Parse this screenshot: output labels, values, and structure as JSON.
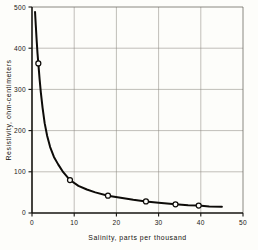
{
  "chart_data": {
    "type": "line",
    "title": "",
    "xlabel": "Salinity, parts per thousand",
    "ylabel": "Resistivity, ohm-centimeters",
    "xlim": [
      0,
      50
    ],
    "ylim": [
      0,
      500
    ],
    "xticks": [
      0,
      10,
      20,
      30,
      40,
      50
    ],
    "xticklabels": [
      "0",
      "10",
      "20",
      "30",
      "40",
      "50"
    ],
    "yticks": [
      0,
      100,
      200,
      300,
      400,
      500
    ],
    "yticklabels": [
      "0",
      "100",
      "200",
      "300",
      "400",
      "500"
    ],
    "grid": true,
    "grid_color": "#8d8a83",
    "legend": false,
    "curve_color": "#0d0b08",
    "marker_style": "open-circle",
    "series": [
      {
        "name": "Resistivity vs salinity",
        "x": [
          1.5,
          9,
          18,
          27,
          34,
          39.5
        ],
        "values": [
          363,
          80,
          42,
          28,
          21,
          18
        ]
      }
    ],
    "curve_points": {
      "x": [
        0.72,
        0.9,
        1.1,
        1.3,
        1.5,
        1.8,
        2.1,
        2.5,
        3.0,
        3.6,
        4.3,
        5.2,
        6.2,
        7.4,
        9.0,
        11.0,
        13.0,
        15.0,
        18.0,
        21.0,
        24.0,
        27.0,
        30.0,
        34.0,
        37.0,
        39.5,
        42.0,
        45.0
      ],
      "y": [
        488,
        455,
        420,
        388,
        363,
        325,
        292,
        256,
        218,
        187,
        160,
        136,
        118,
        99,
        80,
        66,
        57,
        50,
        42,
        37,
        32,
        28,
        25,
        21,
        19,
        18,
        16,
        15
      ]
    }
  },
  "caption": {
    "cut_off_line": ""
  }
}
